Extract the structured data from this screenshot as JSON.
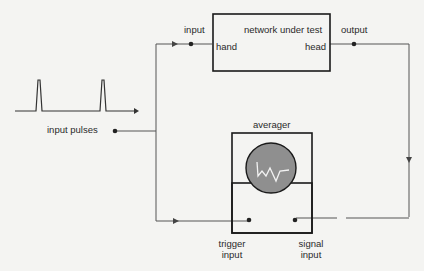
{
  "network": {
    "title": "network under test",
    "left_port": "hand",
    "right_port": "head",
    "input_label": "input",
    "output_label": "output"
  },
  "source": {
    "label": "input pulses"
  },
  "averager": {
    "title": "averager",
    "trigger_label_line1": "trigger",
    "trigger_label_line2": "input",
    "signal_label_line1": "signal",
    "signal_label_line2": "input"
  },
  "colors": {
    "line": "#555555",
    "box": "#1a1a1a",
    "screen": "#8f8f8f",
    "trace": "#f2f2f2",
    "background": "#f4f4f2"
  }
}
